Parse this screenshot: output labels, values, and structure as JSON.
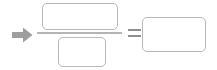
{
  "equation": {
    "arrow": {
      "icon": "arrow-right-icon",
      "color": "#9e9e9e",
      "direction": "right"
    },
    "fraction": {
      "numerator": {
        "label": "",
        "placeholder": "",
        "value": "",
        "state": "empty"
      },
      "bar": {
        "icon": "fraction-bar",
        "color": "#b4b4b4"
      },
      "denominator": {
        "label": "",
        "placeholder": "",
        "value": "",
        "state": "empty"
      }
    },
    "operator": {
      "symbol": "=",
      "icon": "equals-icon",
      "color": "#8f8f8f"
    },
    "result": {
      "label": "",
      "placeholder": "",
      "value": "",
      "state": "empty"
    },
    "colors": {
      "box_border": "#b9b9b9",
      "box_fill": "#ffffff",
      "background": "#ffffff"
    }
  }
}
